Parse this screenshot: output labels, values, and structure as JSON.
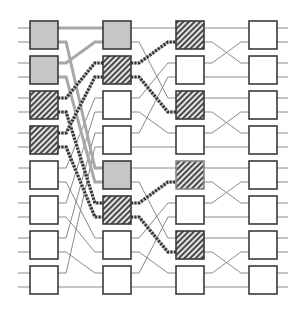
{
  "diagram": {
    "type": "multistage-interconnection-network",
    "stages": 4,
    "boxes_per_stage": 8,
    "ports_per_box": 2,
    "colors": {
      "wire": "#8a8a8a",
      "box_border": "#3a3a3a",
      "box_fill": "#ffffff",
      "gray_fill": "#c6c6c6",
      "gray_wire": "#a8a8a8",
      "hatch_fg": "#4a4a4a",
      "hatch_bg": "#e4e4e4",
      "hatch_wire_dark": "#333333",
      "hatch_wire_light": "#bdbdbd"
    },
    "geometry": {
      "column_x": [
        30,
        103,
        176,
        249
      ],
      "box_width": 28,
      "box_height": 28,
      "row_top": [
        21,
        56,
        91,
        126,
        161,
        196,
        231,
        266
      ],
      "port_offsets": [
        7,
        21
      ],
      "stub_length": 11
    },
    "box_states": [
      [
        "gray",
        "gray",
        "hatched",
        "hatched",
        "plain",
        "plain",
        "plain",
        "plain"
      ],
      [
        "gray",
        "hatched",
        "plain",
        "plain",
        "gray",
        "hatched",
        "plain",
        "plain"
      ],
      [
        "hatched",
        "plain",
        "hatched",
        "plain",
        "hatched",
        "plain",
        "hatched",
        "plain"
      ],
      [
        "plain",
        "plain",
        "plain",
        "plain",
        "plain",
        "plain",
        "plain",
        "plain"
      ]
    ],
    "connections": [
      {
        "from_stage": 0,
        "to_stage": 1,
        "pattern": "unshuffle-16",
        "map": [
          0,
          8,
          1,
          9,
          2,
          10,
          3,
          11,
          4,
          12,
          5,
          13,
          6,
          14,
          7,
          15
        ]
      },
      {
        "from_stage": 1,
        "to_stage": 2,
        "pattern": "unshuffle-8-blocks",
        "map": [
          0,
          4,
          1,
          5,
          2,
          6,
          3,
          7,
          8,
          12,
          9,
          13,
          10,
          14,
          11,
          15
        ]
      },
      {
        "from_stage": 2,
        "to_stage": 3,
        "pattern": "unshuffle-4-blocks",
        "map": [
          0,
          2,
          1,
          3,
          4,
          6,
          5,
          7,
          8,
          10,
          9,
          11,
          12,
          14,
          13,
          15
        ]
      }
    ]
  }
}
